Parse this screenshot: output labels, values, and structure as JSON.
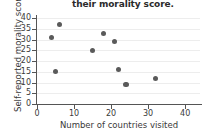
{
  "chart_data": {
    "type": "scatter",
    "title": "their morality score.",
    "xlabel": "Number of countries visited",
    "ylabel": "Self-reported morality score",
    "xlim": [
      0,
      44
    ],
    "ylim": [
      0,
      41
    ],
    "xticks": [
      0,
      10,
      20,
      30,
      40
    ],
    "yticks": [
      0,
      5,
      10,
      15,
      20,
      25,
      30,
      35,
      40
    ],
    "grid": "horizontal",
    "legend": "none",
    "marker_color": "#5a5a5a",
    "points": [
      {
        "x": 4,
        "y": 31
      },
      {
        "x": 6,
        "y": 37
      },
      {
        "x": 5,
        "y": 15
      },
      {
        "x": 15,
        "y": 25
      },
      {
        "x": 18,
        "y": 33
      },
      {
        "x": 21,
        "y": 29
      },
      {
        "x": 22,
        "y": 16
      },
      {
        "x": 24,
        "y": 9
      },
      {
        "x": 32,
        "y": 12
      }
    ]
  },
  "colors": {
    "axis": "#555555",
    "grid": "#ededed",
    "text": "#3a3a3a",
    "marker": "#5a5a5a",
    "background": "#ffffff"
  }
}
